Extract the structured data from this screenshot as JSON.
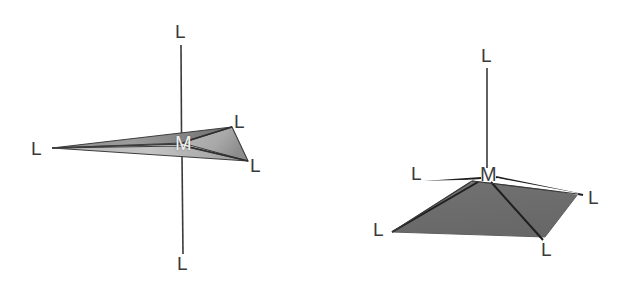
{
  "figure": {
    "background_color": "#ffffff",
    "stroke_color": "#2b2b2b",
    "fill_gray_dark": "#6b6b6b",
    "fill_gray_light": "#c9c9c9",
    "label_color": "#3a3a3a",
    "label_color_on_fill": "#f0f0f0"
  },
  "structures": [
    {
      "id": "trigonal-bipyramidal",
      "name": "trigonal-bipyramidal",
      "center": {
        "label": "M",
        "x": 182,
        "y": 143
      },
      "ligands": [
        {
          "label": "L",
          "position": "axial-top",
          "x": 181,
          "y": 31
        },
        {
          "label": "L",
          "position": "axial-bottom",
          "x": 183,
          "y": 263
        },
        {
          "label": "L",
          "position": "equatorial-left",
          "x": 37,
          "y": 148
        },
        {
          "label": "L",
          "position": "equatorial-upper-right",
          "x": 240,
          "y": 121
        },
        {
          "label": "L",
          "position": "equatorial-lower-right",
          "x": 256,
          "y": 165
        }
      ],
      "vertices": {
        "apex_left": {
          "x": 52,
          "y": 148
        },
        "upper_right": {
          "x": 232,
          "y": 127
        },
        "lower_right": {
          "x": 248,
          "y": 161
        },
        "center": {
          "x": 182,
          "y": 143
        }
      },
      "axis_line": {
        "x": 181,
        "y_top": 45,
        "y_bottom": 254
      }
    },
    {
      "id": "square-pyramidal",
      "name": "square-pyramidal",
      "center": {
        "label": "M",
        "x": 487,
        "y": 174
      },
      "ligands": [
        {
          "label": "L",
          "position": "apical-top",
          "x": 487,
          "y": 55
        },
        {
          "label": "L",
          "position": "basal-upper-left",
          "x": 417,
          "y": 173
        },
        {
          "label": "L",
          "position": "basal-lower-left",
          "x": 379,
          "y": 229
        },
        {
          "label": "L",
          "position": "basal-lower-right",
          "x": 547,
          "y": 249
        },
        {
          "label": "L",
          "position": "basal-right",
          "x": 594,
          "y": 197
        }
      ],
      "vertices": {
        "top": {
          "x": 472,
          "y": 181
        },
        "left": {
          "x": 392,
          "y": 232
        },
        "bottom": {
          "x": 545,
          "y": 237
        },
        "right": {
          "x": 578,
          "y": 194
        },
        "center": {
          "x": 487,
          "y": 174
        }
      },
      "axis_line": {
        "x": 487,
        "y_top": 68,
        "y_bottom": 168
      }
    }
  ]
}
